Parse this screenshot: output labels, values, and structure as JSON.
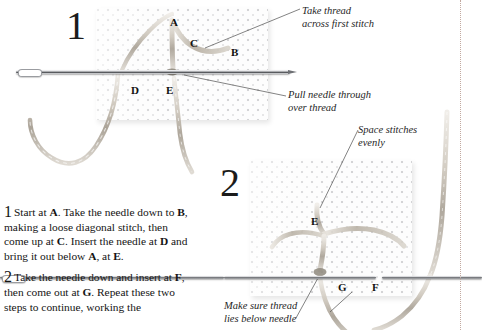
{
  "page": {
    "background": "#ffffff"
  },
  "colors": {
    "text": "#141414",
    "annotation": "#262626",
    "fabric": "#fdfdfd",
    "fabric_dots": "#96969b",
    "thread": "#b9b2a8",
    "needle": "#8e9094",
    "guide_rule": "#c2a9a0"
  },
  "steps": [
    {
      "number": "1",
      "panel_labels": [
        {
          "letter": "A",
          "x": 170,
          "y": 17
        },
        {
          "letter": "C",
          "x": 190,
          "y": 38
        },
        {
          "letter": "B",
          "x": 231,
          "y": 47
        },
        {
          "letter": "D",
          "x": 131,
          "y": 85
        },
        {
          "letter": "E",
          "x": 166,
          "y": 85
        }
      ],
      "annotations": [
        {
          "id": "take-thread",
          "text": "Take thread\nacross first stitch",
          "x": 302,
          "y": 5
        },
        {
          "id": "pull-needle",
          "text": "Pull needle through\nover thread",
          "x": 288,
          "y": 89
        }
      ]
    },
    {
      "number": "2",
      "panel_labels": [
        {
          "letter": "E",
          "x": 311,
          "y": 216
        },
        {
          "letter": "G",
          "x": 338,
          "y": 260
        },
        {
          "letter": "F",
          "x": 372,
          "y": 260
        }
      ],
      "annotations": [
        {
          "id": "space-stitches",
          "text": "Space stitches\nevenly",
          "x": 358,
          "y": 124
        },
        {
          "id": "thread-below-needle",
          "text": "Make sure thread\nlies below needle",
          "x": 224,
          "y": 300
        }
      ]
    }
  ],
  "instructions": [
    {
      "number": "1",
      "text_runs": [
        {
          "t": "Start at "
        },
        {
          "t": "A",
          "b": true
        },
        {
          "t": ". Take the needle down to "
        },
        {
          "t": "B",
          "b": true
        },
        {
          "t": ", making a loose diagonal stitch, then come up at "
        },
        {
          "t": "C",
          "b": true
        },
        {
          "t": ". Insert the needle at "
        },
        {
          "t": "D",
          "b": true
        },
        {
          "t": " and bring it out below "
        },
        {
          "t": "A",
          "b": true
        },
        {
          "t": ", at "
        },
        {
          "t": "E",
          "b": true
        },
        {
          "t": "."
        }
      ]
    },
    {
      "number": "2",
      "text_runs": [
        {
          "t": "Take the needle down and insert at "
        },
        {
          "t": "F",
          "b": true
        },
        {
          "t": ", then come out at "
        },
        {
          "t": "G",
          "b": true
        },
        {
          "t": ". Repeat these two steps to continue, working the"
        }
      ]
    }
  ]
}
